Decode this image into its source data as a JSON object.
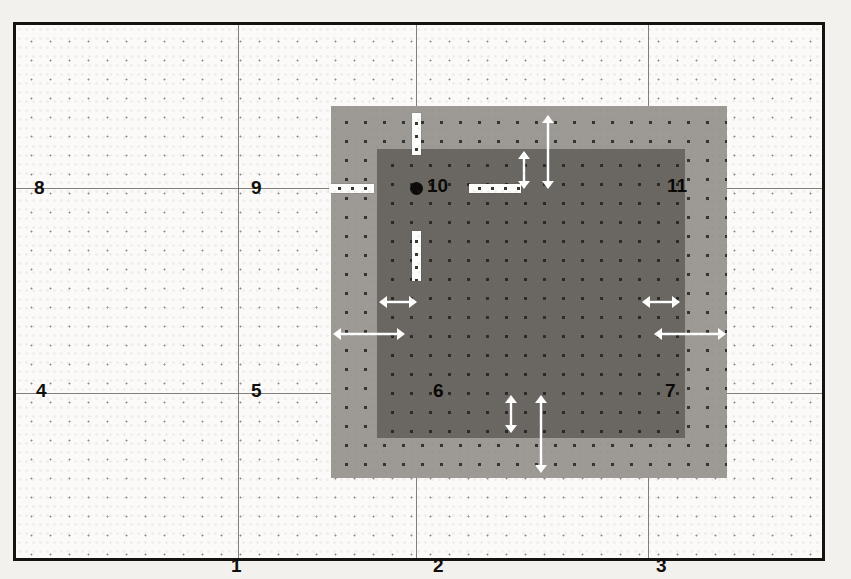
{
  "figure": {
    "kind": "grid-diagram",
    "background_color": "#f3f1ee",
    "frame_color": "#15130f",
    "gridline_color": "#6d6862",
    "outer_rect_color": "#9d9a95",
    "inner_rect_color": "#6a6762",
    "marker_color": "#fdfdfb",
    "arrow_color": "#ffffff"
  },
  "grid": {
    "vertical_lines": [
      235,
      413,
      645
    ],
    "horizontal_lines": [
      185,
      390
    ],
    "columns": 4,
    "rows": 3
  },
  "cells": [
    {
      "label": "1",
      "x": 228,
      "y": 553,
      "on_dark": false
    },
    {
      "label": "2",
      "x": 430,
      "y": 553,
      "on_dark": false
    },
    {
      "label": "3",
      "x": 653,
      "y": 553,
      "on_dark": false
    },
    {
      "label": "4",
      "x": 33,
      "y": 378,
      "on_dark": false
    },
    {
      "label": "5",
      "x": 248,
      "y": 378,
      "on_dark": false
    },
    {
      "label": "6",
      "x": 430,
      "y": 378,
      "on_dark": true
    },
    {
      "label": "7",
      "x": 662,
      "y": 378,
      "on_dark": true
    },
    {
      "label": "8",
      "x": 31,
      "y": 175,
      "on_dark": false
    },
    {
      "label": "9",
      "x": 248,
      "y": 175,
      "on_dark": false
    },
    {
      "label": "10",
      "x": 424,
      "y": 173,
      "on_dark": true
    },
    {
      "label": "11",
      "x": 664,
      "y": 173,
      "on_dark": true
    }
  ],
  "rect_outer": {
    "left": 328,
    "top": 103,
    "width": 396,
    "height": 372
  },
  "rect_inner": {
    "left": 374,
    "top": 146,
    "width": 308,
    "height": 289
  },
  "crosshair": {
    "center_x": 413,
    "center_y": 185,
    "bar_thickness": 9,
    "arm_up": {
      "x": 409,
      "y": 110,
      "w": 9,
      "h": 42
    },
    "arm_down": {
      "x": 409,
      "y": 228,
      "w": 9,
      "h": 50
    },
    "arm_left": {
      "x": 326,
      "y": 181,
      "w": 45,
      "h": 9
    },
    "arm_right": {
      "x": 466,
      "y": 181,
      "w": 52,
      "h": 9
    }
  },
  "arrows": [
    {
      "name": "margin-top-inner-right",
      "orientation": "vertical",
      "x": 521,
      "y": 148,
      "length": 38
    },
    {
      "name": "margin-top-outer-right",
      "orientation": "vertical",
      "x": 545,
      "y": 112,
      "length": 74
    },
    {
      "name": "margin-bottom-inner",
      "orientation": "vertical",
      "x": 508,
      "y": 392,
      "length": 38
    },
    {
      "name": "margin-bottom-outer",
      "orientation": "vertical",
      "x": 538,
      "y": 392,
      "length": 78
    },
    {
      "name": "margin-left-inner",
      "orientation": "horizontal",
      "x": 376,
      "y": 299,
      "length": 38
    },
    {
      "name": "margin-left-outer",
      "orientation": "horizontal",
      "x": 330,
      "y": 331,
      "length": 72
    },
    {
      "name": "margin-right-inner",
      "orientation": "horizontal",
      "x": 639,
      "y": 299,
      "length": 38
    },
    {
      "name": "margin-right-outer",
      "orientation": "horizontal",
      "x": 651,
      "y": 331,
      "length": 72
    }
  ]
}
